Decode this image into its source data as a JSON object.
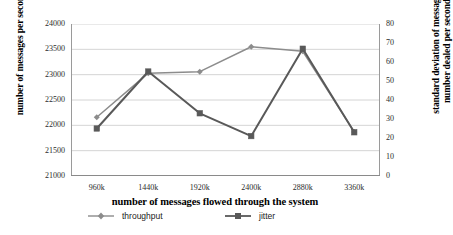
{
  "chart_data": {
    "type": "line",
    "title": "",
    "xlabel": "number of messages flowed through the system",
    "categories": [
      "960k",
      "1440k",
      "1920k",
      "2400k",
      "2880k",
      "3360k"
    ],
    "grid": true,
    "legend_position": "bottom",
    "axes": {
      "left": {
        "label": "number of messages per second",
        "ticks": [
          "21000",
          "21500",
          "22000",
          "22500",
          "23000",
          "23500",
          "24000"
        ],
        "ylim": [
          21000,
          24000
        ]
      },
      "right": {
        "label_line1": "standard deviation of messages'",
        "label_line2": "number dealed per second",
        "ticks": [
          "0",
          "10",
          "20",
          "30",
          "40",
          "50",
          "60",
          "70",
          "80"
        ],
        "ylim": [
          0,
          80
        ]
      }
    },
    "series": [
      {
        "name": "throughput",
        "axis": "left",
        "marker": "diamond",
        "color": "#8c8c8c",
        "values": [
          22160,
          23030,
          23060,
          23550,
          23460,
          21870
        ]
      },
      {
        "name": "jitter",
        "axis": "right",
        "marker": "square",
        "color": "#595959",
        "values": [
          25,
          55,
          33,
          21,
          67,
          23
        ]
      }
    ]
  },
  "legend": {
    "throughput_label": "throughput",
    "jitter_label": "jitter"
  }
}
